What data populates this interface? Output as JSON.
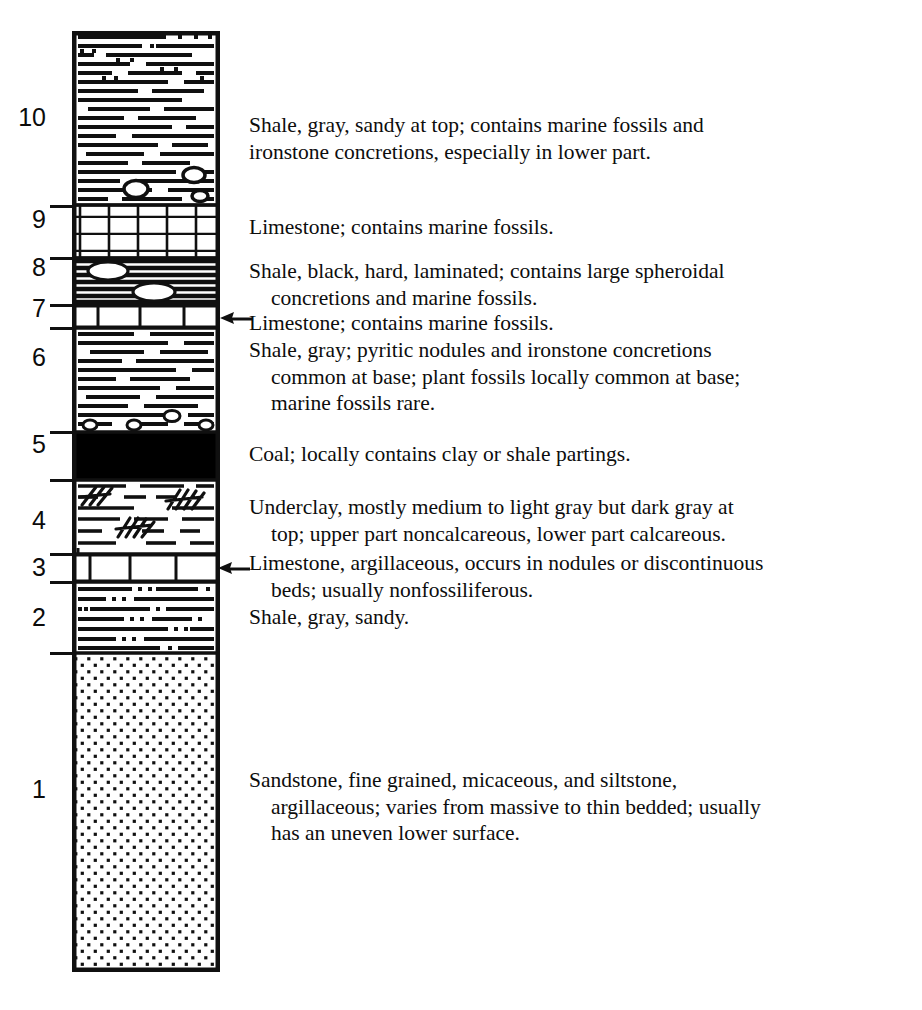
{
  "figure": {
    "type": "stratigraphic-column"
  },
  "column": {
    "left_px": 72,
    "top_px": 31,
    "width_px": 148,
    "height_px": 941,
    "outline_color": "#101010",
    "fill_color": "#ffffff"
  },
  "units": [
    {
      "number": "10",
      "label_top_px": 105,
      "lithology": "shale",
      "pattern": "horizontal-dashes",
      "top_px": 31,
      "bottom_px": 205,
      "sandy_top": true,
      "concretions": true
    },
    {
      "number": "9",
      "label_top_px": 207,
      "lithology": "limestone",
      "pattern": "brick",
      "top_px": 205,
      "bottom_px": 258
    },
    {
      "number": "8",
      "label_top_px": 255,
      "lithology": "black-shale",
      "pattern": "dense-black-laminations",
      "top_px": 258,
      "bottom_px": 305,
      "concretions": true
    },
    {
      "number": "7",
      "label_top_px": 296,
      "lithology": "limestone",
      "pattern": "brick",
      "top_px": 305,
      "bottom_px": 328
    },
    {
      "number": "6",
      "label_top_px": 345,
      "lithology": "shale",
      "pattern": "horizontal-dashes",
      "top_px": 328,
      "bottom_px": 432,
      "nodules_at_base": true
    },
    {
      "number": "5",
      "label_top_px": 432,
      "lithology": "coal",
      "pattern": "solid-black",
      "top_px": 432,
      "bottom_px": 480
    },
    {
      "number": "4",
      "label_top_px": 508,
      "lithology": "underclay",
      "pattern": "dashes-with-root-hatching",
      "top_px": 480,
      "bottom_px": 554
    },
    {
      "number": "3",
      "label_top_px": 555,
      "lithology": "limestone",
      "pattern": "brick-single-row",
      "top_px": 554,
      "bottom_px": 582
    },
    {
      "number": "2",
      "label_top_px": 605,
      "lithology": "sandy-shale",
      "pattern": "dashes-with-dots",
      "top_px": 582,
      "bottom_px": 653
    },
    {
      "number": "1",
      "label_top_px": 777,
      "lithology": "sandstone",
      "pattern": "dot-stipple",
      "top_px": 653,
      "bottom_px": 972
    }
  ],
  "ticks": [
    {
      "y_px": 205
    },
    {
      "y_px": 258
    },
    {
      "y_px": 305
    },
    {
      "y_px": 328
    },
    {
      "y_px": 432
    },
    {
      "y_px": 480
    },
    {
      "y_px": 554
    },
    {
      "y_px": 582
    },
    {
      "y_px": 653
    }
  ],
  "descriptions": [
    {
      "unit": "10",
      "top_px": 112,
      "first_line": "Shale, gray, sandy at top; contains marine fossils and",
      "continuation": [
        "ironstone concretions, especially in lower part."
      ],
      "hanging": false
    },
    {
      "unit": "9",
      "top_px": 214,
      "first_line": "Limestone; contains marine fossils.",
      "continuation": [],
      "hanging": false
    },
    {
      "unit": "8",
      "top_px": 258,
      "first_line": "Shale, black, hard, laminated; contains large spheroidal",
      "continuation": [
        "concretions and marine fossils."
      ],
      "hanging": true
    },
    {
      "unit": "7",
      "top_px": 310,
      "first_line": "Limestone; contains marine fossils.",
      "continuation": [],
      "hanging": false
    },
    {
      "unit": "6",
      "top_px": 337,
      "first_line": "Shale, gray; pyritic nodules and ironstone concretions",
      "continuation": [
        "common at base; plant fossils locally common at base;",
        "marine fossils rare."
      ],
      "hanging": true
    },
    {
      "unit": "5",
      "top_px": 441,
      "first_line": "Coal; locally contains clay or shale partings.",
      "continuation": [],
      "hanging": false
    },
    {
      "unit": "4",
      "top_px": 494,
      "first_line": "Underclay, mostly medium to light gray but dark gray at",
      "continuation": [
        "top; upper part noncalcareous, lower part calcareous."
      ],
      "hanging": true
    },
    {
      "unit": "3",
      "top_px": 550,
      "first_line": "Limestone, argillaceous, occurs in nodules or discontinuous",
      "continuation": [
        "beds; usually nonfossiliferous."
      ],
      "hanging": true
    },
    {
      "unit": "2",
      "top_px": 604,
      "first_line": "Shale, gray, sandy.",
      "continuation": [],
      "hanging": false
    },
    {
      "unit": "1",
      "top_px": 767,
      "first_line": "Sandstone, fine grained, micaceous, and siltstone,",
      "continuation": [
        "argillaceous; varies from massive to thin bedded; usually",
        "has an uneven lower surface."
      ],
      "hanging": true
    }
  ],
  "arrows": [
    {
      "points_to_unit": "7",
      "y_px": 318,
      "tail_x_px": 248,
      "head_x_px": 222
    },
    {
      "points_to_unit": "3",
      "y_px": 568,
      "tail_x_px": 248,
      "head_x_px": 220
    }
  ],
  "colors": {
    "ink": "#101010",
    "paper": "#ffffff",
    "coal": "#000000"
  }
}
